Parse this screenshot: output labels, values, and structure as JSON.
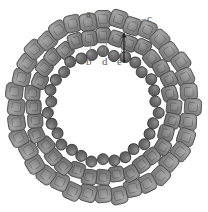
{
  "figure": {
    "type": "diagram",
    "background": "#ffffff",
    "center": {
      "x": 103,
      "y": 107
    },
    "rings": [
      {
        "id": "outer-ring",
        "subunit_shape": "rounded-square",
        "count": 36,
        "radius": 88,
        "size": 17,
        "fill": "#8c8c8c",
        "stroke": "#4f4f4f",
        "highlight": "#a8a8a8"
      },
      {
        "id": "middle-ring",
        "subunit_shape": "rounded-square",
        "count": 32,
        "radius": 70,
        "size": 15,
        "fill": "#828282",
        "stroke": "#4a4a4a",
        "highlight": "#9e9e9e"
      },
      {
        "id": "inner-ring",
        "subunit_shape": "circle",
        "count": 30,
        "radius": 54,
        "size": 11,
        "fill": "#6b6b6b",
        "stroke": "#3d3d3d",
        "highlight": "#8a8a8a"
      }
    ],
    "labels": [
      {
        "id": "a",
        "text": "a",
        "x": 86,
        "y": 8,
        "leader": {
          "x1": 86,
          "y1": 19,
          "x2": 81,
          "y2": 24
        }
      },
      {
        "id": "c",
        "text": "c",
        "x": 147,
        "y": 13,
        "leader": {
          "x1": 146,
          "y1": 19,
          "x2": 124,
          "y2": 24
        }
      },
      {
        "id": "b",
        "text": "b",
        "x": 86,
        "y": 56,
        "leader": {
          "x1": 89,
          "y1": 55,
          "x2": 93,
          "y2": 38
        }
      },
      {
        "id": "d",
        "text": "d",
        "x": 102,
        "y": 56,
        "leader": {
          "x1": 105,
          "y1": 55,
          "x2": 107,
          "y2": 40
        }
      },
      {
        "id": "e",
        "text": "e",
        "x": 117,
        "y": 56,
        "leader": {
          "x1": 121,
          "y1": 55,
          "x2": 124,
          "y2": 40
        }
      }
    ],
    "pointer": {
      "id": "e-arrow",
      "description": "dark vertical arrow pointing up toward middle ring",
      "x": 124,
      "y_top": 32,
      "y_bottom": 62,
      "color": "#2a2a2a"
    }
  }
}
